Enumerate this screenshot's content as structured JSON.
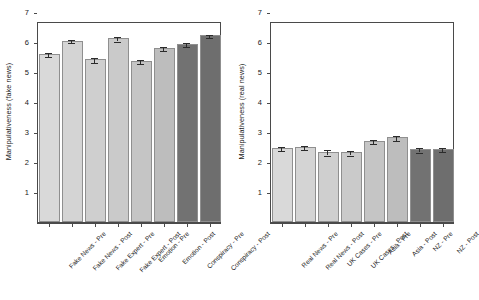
{
  "chart_data": [
    {
      "type": "bar",
      "panel": "left",
      "title": "",
      "xlabel": "",
      "ylabel": "Manipulativeness (fake news)",
      "ylim": [
        0,
        7.3
      ],
      "yticks": [
        1,
        2,
        3,
        4,
        5,
        6,
        7
      ],
      "grid": false,
      "legend": "none",
      "categories": [
        "Fake News - Pre",
        "Fake News - Post",
        "Fake Expert - Pre",
        "Fake Expert - Post",
        "Emotion - Pre",
        "Emotion - Post",
        "Conspiracy - Pre",
        "Conspiracy - Post"
      ],
      "values": [
        5.6,
        6.05,
        5.42,
        6.12,
        5.37,
        5.8,
        5.94,
        6.22
      ],
      "errors": [
        0.06,
        0.05,
        0.09,
        0.07,
        0.06,
        0.06,
        0.07,
        0.06
      ],
      "colors": [
        "#d9d9d9",
        "#d4d4d4",
        "#cfcfcf",
        "#cacaca",
        "#c5c5c5",
        "#bdbdbd",
        "#727272",
        "#6e6e6e"
      ]
    },
    {
      "type": "bar",
      "panel": "right",
      "title": "",
      "xlabel": "",
      "ylabel": "Manipulativeness (real news)",
      "ylim": [
        0,
        7.3
      ],
      "yticks": [
        1,
        2,
        3,
        4,
        5,
        6,
        7
      ],
      "grid": false,
      "legend": "none",
      "categories": [
        "Real News - Pre",
        "Real News - Post",
        "UK Cases - Pre",
        "UK Cases - Post",
        "Asia - Pre",
        "Asia - Post",
        "NZ - Pre",
        "NZ - Post"
      ],
      "values": [
        2.46,
        2.5,
        2.34,
        2.33,
        2.7,
        2.82,
        2.42,
        2.44
      ],
      "errors": [
        0.06,
        0.06,
        0.09,
        0.08,
        0.08,
        0.09,
        0.07,
        0.07
      ],
      "colors": [
        "#d9d9d9",
        "#d4d4d4",
        "#cfcfcf",
        "#cacaca",
        "#c5c5c5",
        "#bdbdbd",
        "#727272",
        "#6e6e6e"
      ]
    }
  ],
  "axis": {
    "tick_color": "#4a4a4a",
    "bar_edge_color": "#8f8f8f",
    "error_color": "#2b2b2b"
  }
}
